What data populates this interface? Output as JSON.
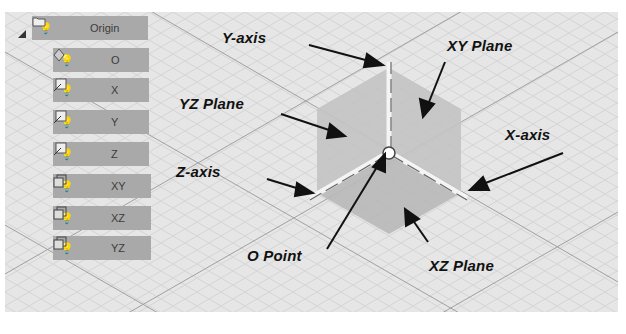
{
  "tree": {
    "root": {
      "label": "Origin",
      "icon": "folder-icon"
    },
    "items": [
      {
        "label": "O",
        "icon": "point-icon"
      },
      {
        "label": "X",
        "icon": "axis-icon"
      },
      {
        "label": "Y",
        "icon": "axis-icon"
      },
      {
        "label": "Z",
        "icon": "axis-icon"
      },
      {
        "label": "XY",
        "icon": "plane-icon"
      },
      {
        "label": "XZ",
        "icon": "plane-icon"
      },
      {
        "label": "YZ",
        "icon": "plane-icon"
      }
    ]
  },
  "callouts": {
    "y_axis": "Y-axis",
    "xy_plane": "XY Plane",
    "yz_plane": "YZ Plane",
    "x_axis": "X-axis",
    "z_axis": "Z-axis",
    "o_point": "O Point",
    "xz_plane": "XZ Plane"
  },
  "colors": {
    "grid_bg": "#e6e6e6",
    "row_bg": "#a9a9a9",
    "plane_fill": "#c4c4c4",
    "text": "#111111"
  }
}
